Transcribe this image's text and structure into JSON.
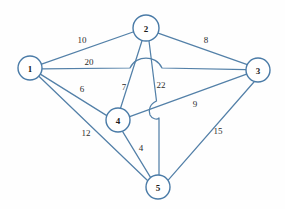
{
  "diagram": {
    "type": "node-link-graph",
    "colors": {
      "edge_stroke": "#5380a8",
      "node_stroke": "#4a7ba7",
      "node_fill": "#ffffff",
      "label_text": "#1a1a1a",
      "weight_text": "#2b2b2b",
      "background": "#fefefe"
    },
    "nodes": [
      {
        "id": "1",
        "label": "1",
        "cx": 30,
        "cy": 68,
        "r": 12
      },
      {
        "id": "2",
        "label": "2",
        "cx": 146,
        "cy": 28,
        "r": 13
      },
      {
        "id": "3",
        "label": "3",
        "cx": 258,
        "cy": 70,
        "r": 12
      },
      {
        "id": "4",
        "label": "4",
        "cx": 118,
        "cy": 120,
        "r": 12
      },
      {
        "id": "5",
        "label": "5",
        "cx": 158,
        "cy": 187,
        "r": 12
      }
    ],
    "edges": [
      {
        "from": "1",
        "to": "2",
        "weight": "10",
        "label_x": 82,
        "label_y": 40
      },
      {
        "from": "1",
        "to": "3",
        "weight": "20",
        "label_x": 89,
        "label_y": 62
      },
      {
        "from": "1",
        "to": "4",
        "weight": "6",
        "label_x": 82,
        "label_y": 89
      },
      {
        "from": "1",
        "to": "5",
        "weight": "12",
        "label_x": 86,
        "label_y": 133
      },
      {
        "from": "2",
        "to": "3",
        "weight": "8",
        "label_x": 206,
        "label_y": 40
      },
      {
        "from": "2",
        "to": "4",
        "weight": "7",
        "label_x": 124,
        "label_y": 87
      },
      {
        "from": "2",
        "to": "5",
        "weight": "22",
        "label_x": 161,
        "label_y": 85
      },
      {
        "from": "3",
        "to": "4",
        "weight": "9",
        "label_x": 195,
        "label_y": 104
      },
      {
        "from": "3",
        "to": "5",
        "weight": "15",
        "label_x": 218,
        "label_y": 131
      },
      {
        "from": "4",
        "to": "5",
        "weight": "4",
        "label_x": 141,
        "label_y": 148
      }
    ]
  }
}
